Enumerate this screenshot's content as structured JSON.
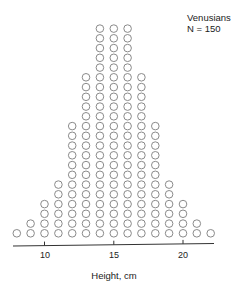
{
  "chart_data": {
    "type": "scatter",
    "subtype": "dot-plot",
    "title": "",
    "legend": {
      "group": "Venusians",
      "n_label": "N = 150"
    },
    "xlabel": "Height, cm",
    "ylabel": "",
    "xlim": [
      8,
      22
    ],
    "x_ticks": [
      10,
      15,
      20
    ],
    "x_tick_labels": [
      "10",
      "15",
      "20"
    ],
    "grid": false,
    "legend_position": "top-right",
    "categories": [
      8,
      9,
      10,
      11,
      12,
      13,
      14,
      15,
      16,
      17,
      18,
      19,
      20,
      21,
      22
    ],
    "values": [
      1,
      2,
      4,
      6,
      12,
      17,
      22,
      22,
      22,
      17,
      12,
      6,
      4,
      2,
      1
    ],
    "total": 150,
    "marker": "open-circle",
    "marker_color": "#8a8a8a"
  }
}
